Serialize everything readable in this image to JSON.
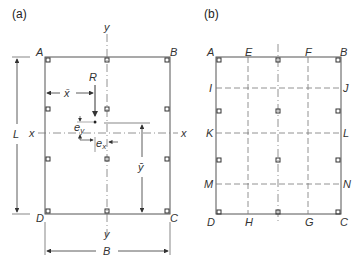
{
  "panels": {
    "a": {
      "label": "(a)",
      "corners": {
        "A": "A",
        "B": "B",
        "C": "C",
        "D": "D"
      },
      "axes": {
        "x_left": "x",
        "x_right": "x",
        "y_top": "y",
        "y_bottom": "y"
      },
      "resultant": "R",
      "xbar": "x̄",
      "ybar": "ȳ",
      "ex": "e",
      "ex_sub": "x",
      "ey": "e",
      "ey_sub": "y",
      "length": "L",
      "breadth": "B"
    },
    "b": {
      "label": "(b)",
      "top": [
        "A",
        "E",
        "F",
        "B"
      ],
      "bottom": [
        "D",
        "H",
        "G",
        "C"
      ],
      "left": [
        "I",
        "K",
        "M"
      ],
      "right": [
        "J",
        "L",
        "N"
      ],
      "x_axis": "x"
    }
  },
  "colors": {
    "line": "#555555",
    "dashed": "#777777",
    "text": "#333333"
  }
}
